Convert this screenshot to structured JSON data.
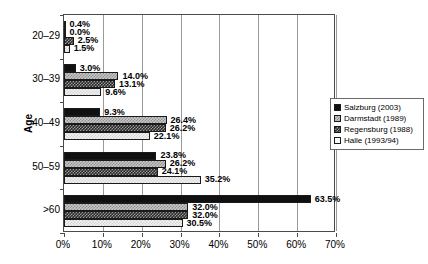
{
  "chart_data": {
    "type": "bar",
    "orientation": "horizontal",
    "title": "",
    "xlabel": "",
    "ylabel": "Age",
    "xlim": [
      0,
      70
    ],
    "xunit": "%",
    "xticks": [
      "0%",
      "10%",
      "20%",
      "30%",
      "40%",
      "50%",
      "60%",
      "70%"
    ],
    "xtick_values": [
      0,
      10,
      20,
      30,
      40,
      50,
      60,
      70
    ],
    "grid": true,
    "legend_position": "right",
    "categories": [
      "20–29",
      "30–39",
      "40–49",
      "50–59",
      ">60"
    ],
    "series": [
      {
        "name": "Salzburg (2003)",
        "pattern": "solid-black",
        "values": [
          0.4,
          3.0,
          9.3,
          23.8,
          63.5
        ],
        "labels": [
          "0.4%",
          "3.0%",
          "9.3%",
          "23.8%",
          "63.5%"
        ]
      },
      {
        "name": "Darmstadt (1989)",
        "pattern": "light-checker",
        "values": [
          0.0,
          14.0,
          26.4,
          26.2,
          32.0
        ],
        "labels": [
          "0.0%",
          "14.0%",
          "26.4%",
          "26.2%",
          "32.0%"
        ]
      },
      {
        "name": "Regensburg (1988)",
        "pattern": "dark-checker",
        "values": [
          2.5,
          13.1,
          26.2,
          24.1,
          32.0
        ],
        "labels": [
          "2.5%",
          "13.1%",
          "26.2%",
          "24.1%",
          "32.0%"
        ]
      },
      {
        "name": "Halle (1993/94)",
        "pattern": "white",
        "values": [
          1.5,
          9.6,
          22.1,
          35.2,
          30.5
        ],
        "labels": [
          "1.5%",
          "9.6%",
          "22.1%",
          "35.2%",
          "30.5%"
        ]
      }
    ]
  },
  "legend": {
    "items": [
      {
        "label": "Salzburg (2003)"
      },
      {
        "label": "Darmstadt (1989)"
      },
      {
        "label": "Regensburg (1988)"
      },
      {
        "label": "Halle (1993/94)"
      }
    ]
  },
  "axis": {
    "y_title": "Age"
  }
}
